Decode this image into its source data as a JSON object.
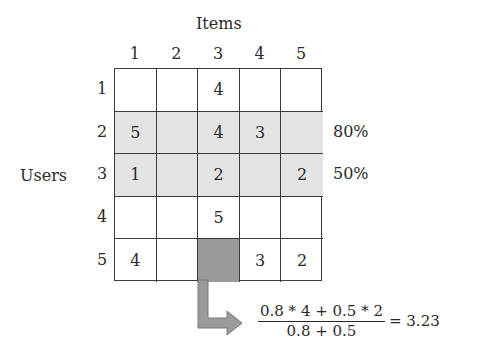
{
  "title": "Items",
  "row_axis_label": "Users",
  "columns": [
    "1",
    "2",
    "3",
    "4",
    "5"
  ],
  "rows": [
    "1",
    "2",
    "3",
    "4",
    "5"
  ],
  "ratings": [
    [
      "",
      "",
      "4",
      "",
      ""
    ],
    [
      "5",
      "",
      "4",
      "3",
      ""
    ],
    [
      "1",
      "",
      "2",
      "",
      "2"
    ],
    [
      "",
      "",
      "5",
      "",
      ""
    ],
    [
      "4",
      "",
      "",
      "3",
      "2"
    ]
  ],
  "highlighted_rows": [
    2,
    3
  ],
  "target_cell": {
    "row": 5,
    "col": 3
  },
  "similarities": {
    "row2": "80%",
    "row3": "50%"
  },
  "formula": {
    "numerator": "0.8 * 4 + 0.5 * 2",
    "denominator": "0.8 + 0.5",
    "result": "= 3.23"
  },
  "colors": {
    "highlight": "#e4e4e4",
    "target": "#999999",
    "arrow": "#9a9a9a",
    "line": "#3a3a3a"
  }
}
